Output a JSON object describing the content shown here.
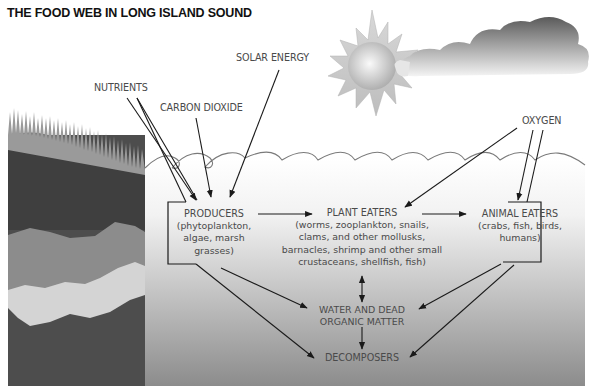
{
  "title": "THE FOOD WEB IN LONG ISLAND SOUND",
  "inputs": {
    "solar_energy": "SOLAR ENERGY",
    "nutrients": "NUTRIENTS",
    "carbon_dioxide": "CARBON DIOXIDE",
    "oxygen": "OXYGEN"
  },
  "nodes": {
    "producers": {
      "head": "PRODUCERS",
      "lines": [
        "(phytoplankton,",
        "algae, marsh",
        "grasses)"
      ]
    },
    "plant_eaters": {
      "head": "PLANT EATERS",
      "lines": [
        "(worms, zooplankton, snails,",
        "clams, and other mollusks,",
        "barnacles, shrimp and other small",
        "crustaceans, shellfish, fish)"
      ]
    },
    "animal_eaters": {
      "head": "ANIMAL EATERS",
      "lines": [
        "(crabs, fish, birds,",
        "humans)"
      ]
    },
    "water_dead_matter": {
      "lines": [
        "WATER AND DEAD",
        "ORGANIC MATTER"
      ]
    },
    "decomposers": {
      "head": "DECOMPOSERS"
    }
  },
  "edges": [
    {
      "from": "nutrients",
      "to": "producers"
    },
    {
      "from": "carbon_dioxide",
      "to": "producers"
    },
    {
      "from": "solar_energy",
      "to": "producers"
    },
    {
      "from": "oxygen",
      "to": "plant_eaters"
    },
    {
      "from": "oxygen",
      "to": "animal_eaters"
    },
    {
      "from": "producers",
      "to": "plant_eaters"
    },
    {
      "from": "plant_eaters",
      "to": "animal_eaters"
    },
    {
      "from": "producers",
      "to": "water_dead_matter"
    },
    {
      "from": "producers",
      "to": "decomposers"
    },
    {
      "from": "plant_eaters",
      "to": "water_dead_matter",
      "bidirectional": true
    },
    {
      "from": "animal_eaters",
      "to": "water_dead_matter"
    },
    {
      "from": "animal_eaters",
      "to": "decomposers"
    },
    {
      "from": "water_dead_matter",
      "to": "decomposers"
    }
  ],
  "colors": {
    "water_top": "#ffffff",
    "water_bottom": "#8a8a8a",
    "shore_dark": "#4d4d4d",
    "shore_mid": "#8c8c8c",
    "shore_light": "#d4d4d4",
    "text": "#4a4a4a",
    "arrow": "#1a1a1a"
  }
}
